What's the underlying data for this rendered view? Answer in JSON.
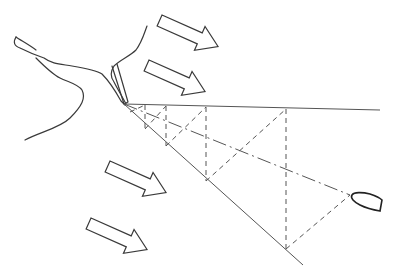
{
  "diagram": {
    "type": "nautical-bearing-diagram",
    "stroke_color": "#3a3a3a",
    "line_color": "#555555",
    "background": "#ffffff",
    "elements": {
      "coastline": {
        "description": "irregular shoreline with harbour entrance channel"
      },
      "harbour_mouth": {
        "x": 123,
        "y": 104
      },
      "boat": {
        "x": 363,
        "y": 200,
        "description": "boat hull outline at end of bearing line"
      },
      "reference_lines": [
        {
          "name": "upper-bearing",
          "style": "solid",
          "from": [
            123,
            104
          ],
          "to": [
            380,
            110
          ]
        },
        {
          "name": "lower-bearing",
          "style": "solid",
          "from": [
            123,
            104
          ],
          "to": [
            303,
            265
          ]
        },
        {
          "name": "course-line",
          "style": "dash-dot",
          "from": [
            123,
            104
          ],
          "to": [
            348,
            195
          ]
        }
      ],
      "perpendiculars": [
        {
          "x": 145,
          "top": 105,
          "bottom": 129
        },
        {
          "x": 166,
          "top": 106,
          "bottom": 146
        },
        {
          "x": 206,
          "top": 107,
          "bottom": 181
        },
        {
          "x": 286,
          "top": 109,
          "bottom": 249
        }
      ],
      "current_arrows": [
        {
          "name": "arrow-1",
          "x": 164,
          "y": 15
        },
        {
          "name": "arrow-2",
          "x": 150,
          "y": 60
        },
        {
          "name": "arrow-3",
          "x": 110,
          "y": 160
        },
        {
          "name": "arrow-4",
          "x": 90,
          "y": 218
        }
      ]
    }
  }
}
